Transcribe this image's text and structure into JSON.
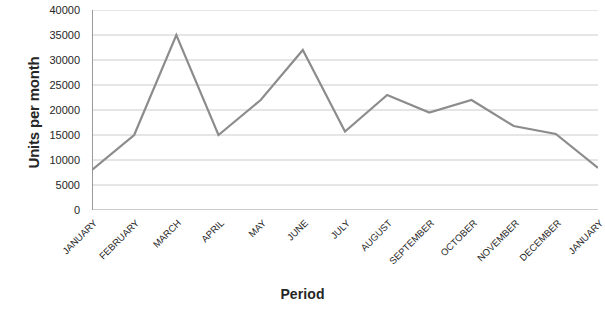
{
  "chart_data": {
    "type": "line",
    "title": "",
    "xlabel": "Period",
    "ylabel": "Units per month",
    "categories": [
      "JANUARY",
      "FEBRUARY",
      "MARCH",
      "APRIL",
      "MAY",
      "JUNE",
      "JULY",
      "AUGUST",
      "SEPTEMBER",
      "OCTOBER",
      "NOVEMBER",
      "DECEMBER",
      "JANUARY"
    ],
    "values": [
      8000,
      15000,
      35000,
      15000,
      22000,
      32000,
      15700,
      23000,
      19500,
      22000,
      16800,
      15200,
      8400
    ],
    "series": [
      {
        "name": "Units per month",
        "values": [
          8000,
          15000,
          35000,
          15000,
          22000,
          32000,
          15700,
          23000,
          19500,
          22000,
          16800,
          15200,
          8400
        ]
      }
    ],
    "ylim": [
      0,
      40000
    ],
    "yticks": [
      0,
      5000,
      10000,
      15000,
      20000,
      25000,
      30000,
      35000,
      40000
    ],
    "ytick_labels": [
      "0",
      "5000",
      "10000",
      "15000",
      "20000",
      "25000",
      "30000",
      "35000",
      "40000"
    ],
    "grid": "horizontal",
    "legend": "none",
    "line_color": "#8c8c8c",
    "grid_color": "#bfbfbf",
    "axis_color": "#9a9a9a",
    "background_color": "#ffffff"
  }
}
